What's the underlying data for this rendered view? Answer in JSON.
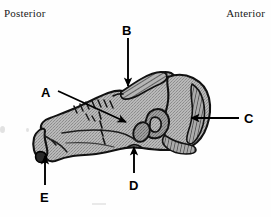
{
  "figure": {
    "domain": "anatomical-illustration",
    "background_color": "#fefefe",
    "bone_fill_color": "#a8a8a8",
    "bone_outline_color": "#111111",
    "label_color": "#000000",
    "orientation_text_color": "#1a1a1a"
  },
  "orientation": {
    "left_label": "Posterior",
    "right_label": "Anterior"
  },
  "callouts": [
    {
      "id": "A",
      "label": "A",
      "label_x": 41,
      "label_y": 86,
      "arrow_direction": "right-down",
      "arrow_from_x": 58,
      "arrow_from_y": 91,
      "arrow_to_x": 126,
      "arrow_to_y": 122
    },
    {
      "id": "B",
      "label": "B",
      "label_x": 122,
      "label_y": 24,
      "arrow_direction": "down",
      "arrow_from_x": 128,
      "arrow_from_y": 38,
      "arrow_to_x": 128,
      "arrow_to_y": 85
    },
    {
      "id": "C",
      "label": "C",
      "label_x": 244,
      "label_y": 112,
      "arrow_direction": "left",
      "arrow_from_x": 239,
      "arrow_from_y": 118,
      "arrow_to_x": 190,
      "arrow_to_y": 118
    },
    {
      "id": "D",
      "label": "D",
      "label_x": 129,
      "label_y": 179,
      "arrow_direction": "up",
      "arrow_from_x": 134,
      "arrow_from_y": 173,
      "arrow_to_x": 134,
      "arrow_to_y": 146
    },
    {
      "id": "E",
      "label": "E",
      "label_x": 40,
      "label_y": 191,
      "arrow_direction": "up",
      "arrow_from_x": 45,
      "arrow_from_y": 185,
      "arrow_to_x": 45,
      "arrow_to_y": 155
    }
  ],
  "icons": {
    "arrow_head": "arrow-head-icon",
    "bone_shape": "bone-silhouette-icon"
  }
}
